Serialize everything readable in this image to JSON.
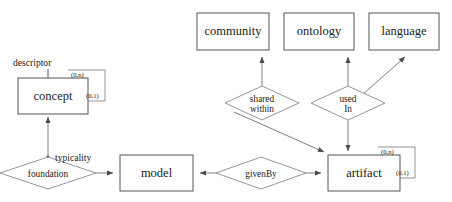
{
  "diagram": {
    "type": "entity-relationship-diagram",
    "entities": [
      {
        "id": "concept",
        "label": "concept",
        "x": 18,
        "y": 78,
        "w": 70,
        "h": 36
      },
      {
        "id": "model",
        "label": "model",
        "x": 120,
        "y": 155,
        "w": 73,
        "h": 36
      },
      {
        "id": "artifact",
        "label": "artifact",
        "x": 328,
        "y": 155,
        "w": 72,
        "h": 36
      },
      {
        "id": "community",
        "label": "community",
        "x": 197,
        "y": 13,
        "w": 72,
        "h": 37
      },
      {
        "id": "ontology",
        "label": "ontology",
        "x": 284,
        "y": 13,
        "w": 70,
        "h": 37
      },
      {
        "id": "language",
        "label": "language",
        "x": 369,
        "y": 13,
        "w": 70,
        "h": 37
      }
    ],
    "relationships": [
      {
        "id": "foundation",
        "label": "foundation",
        "line1": "foundation",
        "line2": "",
        "cx": 48,
        "cy": 173,
        "rx": 48,
        "ry": 16
      },
      {
        "id": "givenBy",
        "label": "givenBy",
        "line1": "givenBy",
        "line2": "",
        "cx": 261,
        "cy": 173,
        "rx": 45,
        "ry": 16
      },
      {
        "id": "shared-within",
        "label": "shared within",
        "line1": "shared",
        "line2": "within",
        "cx": 262,
        "cy": 103,
        "rx": 37,
        "ry": 17
      },
      {
        "id": "used-in",
        "label": "used In",
        "line1": "used",
        "line2": "In",
        "cx": 348,
        "cy": 103,
        "rx": 37,
        "ry": 17
      }
    ],
    "edge_labels": [
      {
        "id": "descriptor",
        "text": "descriptor",
        "x": 13,
        "y": 66
      },
      {
        "id": "typicality",
        "text": "typicality",
        "x": 55,
        "y": 159
      }
    ],
    "cardinalities": [
      {
        "id": "concept-loop-max",
        "text": "(0,n)",
        "x": 71,
        "y": 74
      },
      {
        "id": "concept-loop-min",
        "text": "(0,1)",
        "x": 86,
        "y": 95
      },
      {
        "id": "artifact-loop-max",
        "text": "(0,n)",
        "x": 381,
        "y": 151
      },
      {
        "id": "artifact-loop-min",
        "text": "(0,1)",
        "x": 396,
        "y": 172
      }
    ],
    "colors": {
      "background": "#ffffff",
      "entity_stroke": "#555555",
      "relationship_stroke": "#8a8a8a",
      "edge_stroke": "#6f6f6f",
      "text": "#1a1a1a"
    }
  }
}
